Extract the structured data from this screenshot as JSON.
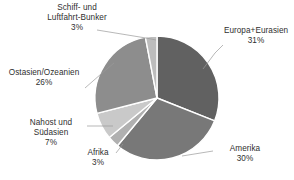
{
  "chart_data": {
    "type": "pie",
    "title": "",
    "subtitle": "",
    "xlabel": "",
    "ylabel": "",
    "legend_position": "none",
    "grid": false,
    "labels_outside": true,
    "value_suffix": "%",
    "start_angle_deg": 0,
    "direction": "clockwise",
    "categories": [
      "Europa+Eurasien",
      "Amerika",
      "Afrika",
      "Nahost und Südasien",
      "Ostasien/Ozeanien",
      "Schiff- und Luftfahrt-Bunker"
    ],
    "values": [
      31,
      30,
      3,
      7,
      26,
      3
    ],
    "colors": [
      "#616161",
      "#787878",
      "#b0b0b0",
      "#c9c9c9",
      "#8d8d8d",
      "#bdbdbd"
    ],
    "slices": [
      {
        "label": "Europa+Eurasien",
        "value": 31,
        "value_text": "31%",
        "color": "#616161"
      },
      {
        "label": "Amerika",
        "value": 30,
        "value_text": "30%",
        "color": "#787878"
      },
      {
        "label": "Afrika",
        "value": 3,
        "value_text": "3%",
        "color": "#b0b0b0"
      },
      {
        "label": "Nahost und Südasien",
        "label_line1": "Nahost und",
        "label_line2": "Südasien",
        "value": 7,
        "value_text": "7%",
        "color": "#c9c9c9"
      },
      {
        "label": "Ostasien/Ozeanien",
        "value": 26,
        "value_text": "26%",
        "color": "#8d8d8d"
      },
      {
        "label": "Schiff- und Luftfahrt-Bunker",
        "label_line1": "Schiff- und",
        "label_line2": "Luftfahrt-Bunker",
        "value": 3,
        "value_text": "3%",
        "color": "#bdbdbd"
      }
    ]
  },
  "callouts": {
    "bunker": {
      "line1": "Schiff- und",
      "line2": "Luftfahrt-Bunker",
      "pct": "3%"
    },
    "ostasien": {
      "line1": "Ostasien/Ozeanien",
      "pct": "26%"
    },
    "nahost": {
      "line1": "Nahost und",
      "line2": "Südasien",
      "pct": "7%"
    },
    "afrika": {
      "line1": "Afrika",
      "pct": "3%"
    },
    "europa": {
      "line1": "Europa+Eurasien",
      "pct": "31%"
    },
    "amerika": {
      "line1": "Amerika",
      "pct": "30%"
    }
  },
  "style": {
    "background": "#ffffff",
    "text_color": "#2f2f2f",
    "leader_color": "#9a9a9a",
    "slice_border": "#ffffff"
  }
}
